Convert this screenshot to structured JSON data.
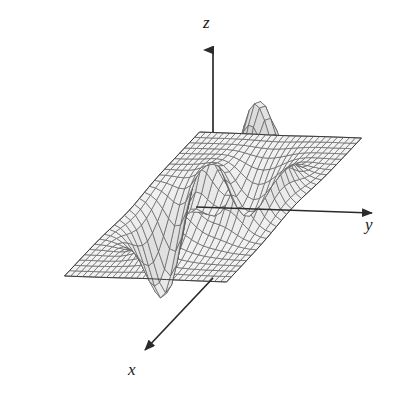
{
  "figure": {
    "title": "",
    "background_color": "#ffffff",
    "width": 396,
    "height": 403
  },
  "axes": {
    "z": {
      "label": "z",
      "name": "z-axis",
      "arrow": "up"
    },
    "y": {
      "label": "y",
      "name": "y-axis",
      "arrow": "right"
    },
    "x": {
      "label": "x",
      "name": "x-axis",
      "arrow": "down-left"
    },
    "axis_color": "#2b2b2b",
    "ticks_shown": false,
    "tick_labels": []
  },
  "surface": {
    "fill_color": "#d9d9d9",
    "line_color": "#555555",
    "edge_color": "#3a3a3a",
    "shading": "grayscale",
    "mesh_rows": 28,
    "mesh_cols": 28
  },
  "chart_data": {
    "type": "surface",
    "title": "",
    "xlabel": "x",
    "ylabel": "y",
    "zlabel": "z",
    "grid": false,
    "legend": null,
    "function": "z = 3*(1-x)^2*exp(-x^2-(y+1)^2) - 10*(x/5 - x^3 - y^5)*exp(-x^2-y^2) - (1/3)*exp(-(x+1)^2-y^2)",
    "xlim": [
      -3,
      3
    ],
    "ylim": [
      -3,
      3
    ],
    "zlim": [
      -7,
      8
    ],
    "x": [
      -3,
      -2.5,
      -2,
      -1.5,
      -1,
      -0.5,
      0,
      0.5,
      1,
      1.5,
      2,
      2.5,
      3
    ],
    "y": [
      -3,
      -2.5,
      -2,
      -1.5,
      -1,
      -0.5,
      0,
      0.5,
      1,
      1.5,
      2,
      2.5,
      3
    ],
    "features": [
      {
        "name": "left-peak",
        "screen_xy": [
          205,
          90
        ],
        "kind": "maximum"
      },
      {
        "name": "right-peak",
        "screen_xy": [
          355,
          95
        ],
        "kind": "maximum"
      },
      {
        "name": "left-trough",
        "screen_xy": [
          110,
          330
        ],
        "kind": "minimum"
      },
      {
        "name": "right-trough",
        "screen_xy": [
          320,
          340
        ],
        "kind": "minimum"
      },
      {
        "name": "saddle",
        "screen_xy": [
          240,
          205
        ],
        "kind": "saddle"
      }
    ],
    "view": {
      "azimuth": -37.5,
      "elevation": 30
    }
  }
}
